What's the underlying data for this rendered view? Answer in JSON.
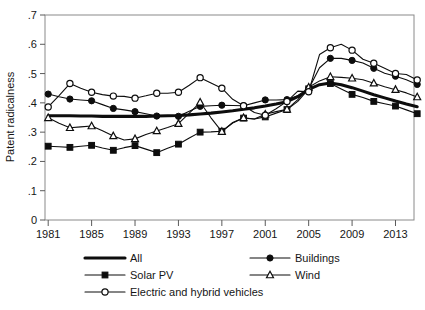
{
  "figure": {
    "background": "#ffffff",
    "ink_color": "#0d0d0d",
    "frame_color": "#8a8a8a"
  },
  "chart_data": {
    "type": "line",
    "title": "",
    "xlabel": "",
    "ylabel": "Patent radicalness",
    "x": [
      1981,
      1982,
      1983,
      1984,
      1985,
      1986,
      1987,
      1988,
      1989,
      1990,
      1991,
      1992,
      1993,
      1994,
      1995,
      1996,
      1997,
      1998,
      1999,
      2000,
      2001,
      2002,
      2003,
      2004,
      2005,
      2006,
      2007,
      2008,
      2009,
      2010,
      2011,
      2012,
      2013,
      2014,
      2015
    ],
    "xlim": [
      1981,
      2015
    ],
    "ylim": [
      0,
      0.7
    ],
    "xticks": [
      1981,
      1985,
      1989,
      1993,
      1997,
      2001,
      2005,
      2009,
      2013
    ],
    "xticklabels": [
      "1981",
      "1985",
      "1989",
      "1993",
      "1997",
      "2001",
      "2005",
      "2009",
      "2013"
    ],
    "yticks": [
      0,
      0.1,
      0.2,
      0.3,
      0.4,
      0.5,
      0.6,
      0.7
    ],
    "yticklabels": [
      "0",
      ".1",
      ".2",
      ".3",
      ".4",
      ".5",
      ".6",
      ".7"
    ],
    "grid": false,
    "legend_position": "below",
    "series": [
      {
        "name": "All",
        "marker": "none",
        "linewidth": "thick",
        "values": [
          0.356,
          0.356,
          0.356,
          0.355,
          0.355,
          0.354,
          0.354,
          0.354,
          0.354,
          0.354,
          0.355,
          0.356,
          0.357,
          0.359,
          0.362,
          0.365,
          0.369,
          0.373,
          0.378,
          0.383,
          0.389,
          0.396,
          0.404,
          0.421,
          0.446,
          0.462,
          0.468,
          0.462,
          0.452,
          0.44,
          0.428,
          0.417,
          0.406,
          0.396,
          0.387
        ]
      },
      {
        "name": "Solar PV",
        "marker": "filled-square",
        "linewidth": "thin",
        "values": [
          0.252,
          0.25,
          0.248,
          0.252,
          0.255,
          0.246,
          0.238,
          0.247,
          0.254,
          0.242,
          0.23,
          0.245,
          0.259,
          0.28,
          0.3,
          0.301,
          0.303,
          0.331,
          0.348,
          0.345,
          0.352,
          0.365,
          0.377,
          0.405,
          0.448,
          0.462,
          0.466,
          0.447,
          0.429,
          0.418,
          0.405,
          0.397,
          0.389,
          0.376,
          0.363
        ]
      },
      {
        "name": "Buildings",
        "marker": "filled-circle",
        "linewidth": "thin",
        "values": [
          0.43,
          0.421,
          0.413,
          0.41,
          0.407,
          0.394,
          0.381,
          0.376,
          0.37,
          0.363,
          0.355,
          0.354,
          0.354,
          0.371,
          0.388,
          0.39,
          0.392,
          0.391,
          0.39,
          0.4,
          0.41,
          0.41,
          0.411,
          0.424,
          0.447,
          0.52,
          0.552,
          0.552,
          0.545,
          0.536,
          0.518,
          0.501,
          0.491,
          0.479,
          0.463
        ]
      },
      {
        "name": "Wind",
        "marker": "open-triangle",
        "linewidth": "thin",
        "values": [
          0.349,
          0.33,
          0.315,
          0.318,
          0.321,
          0.305,
          0.287,
          0.273,
          0.277,
          0.292,
          0.304,
          0.316,
          0.329,
          0.365,
          0.402,
          0.349,
          0.302,
          0.333,
          0.349,
          0.345,
          0.361,
          0.37,
          0.378,
          0.411,
          0.453,
          0.475,
          0.489,
          0.487,
          0.484,
          0.479,
          0.467,
          0.455,
          0.445,
          0.434,
          0.42
        ]
      },
      {
        "name": "Electric and hybrid vehicles",
        "marker": "open-circle",
        "linewidth": "thin",
        "values": [
          0.386,
          0.425,
          0.466,
          0.45,
          0.436,
          0.428,
          0.423,
          0.422,
          0.416,
          0.424,
          0.433,
          0.433,
          0.436,
          0.46,
          0.486,
          0.468,
          0.45,
          0.412,
          0.39,
          0.367,
          0.358,
          0.38,
          0.405,
          0.44,
          0.438,
          0.565,
          0.588,
          0.6,
          0.58,
          0.549,
          0.535,
          0.518,
          0.5,
          0.497,
          0.478
        ]
      }
    ]
  },
  "axes": {
    "ylabel": "Patent radicalness"
  },
  "legend": {
    "entries": [
      {
        "label": "All",
        "marker": "none"
      },
      {
        "label": "Buildings",
        "marker": "filled-circle"
      },
      {
        "label": "Solar PV",
        "marker": "filled-square"
      },
      {
        "label": "Wind",
        "marker": "open-triangle"
      },
      {
        "label": "Electric and hybrid vehicles",
        "marker": "open-circle"
      }
    ]
  }
}
